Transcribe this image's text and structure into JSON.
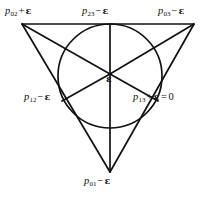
{
  "figure": {
    "type": "geometry-diagram",
    "background_color": "#ffffff",
    "stroke_color": "#111111"
  },
  "labels": {
    "top_left": {
      "name": "p02-plus-epsilon",
      "variable": "p",
      "subscript": "02",
      "operator": "+",
      "epsilon": "ε",
      "full_text": "p02 + ε"
    },
    "top_center": {
      "name": "p23-minus-epsilon",
      "variable": "p",
      "subscript": "23",
      "operator": "−",
      "epsilon": "ε",
      "full_text": "p23 − ε"
    },
    "top_right": {
      "name": "p03-minus-epsilon",
      "variable": "p",
      "subscript": "03",
      "operator": "−",
      "epsilon": "ε",
      "full_text": "p03 − ε"
    },
    "mid_left": {
      "name": "p12-minus-epsilon",
      "variable": "p",
      "subscript": "12",
      "operator": "−",
      "epsilon": "ε",
      "full_text": "p12 − ε"
    },
    "mid_right": {
      "name": "p13-plus-epsilon-equals-zero",
      "variable": "p",
      "subscript": "13",
      "operator": "+",
      "epsilon": "ε",
      "equals": "=",
      "value": "0",
      "full_text": "p13 + ε = 0"
    },
    "bottom": {
      "name": "p01-minus-epsilon",
      "variable": "p",
      "subscript": "01",
      "operator": "−",
      "epsilon": "ε",
      "full_text": "p01 − ε"
    },
    "center": {
      "name": "epsilon-center",
      "epsilon": "ε",
      "full_text": "ε"
    }
  },
  "geometry": {
    "triangle_vertices": [
      {
        "name": "top-left-vertex",
        "x": 22,
        "y": 24
      },
      {
        "name": "top-right-vertex",
        "x": 194,
        "y": 24
      },
      {
        "name": "bottom-vertex",
        "x": 110,
        "y": 172
      }
    ],
    "incircle": {
      "cx": 110,
      "cy": 76,
      "r": 52
    },
    "incenter": {
      "x": 110,
      "y": 74
    },
    "tangent_points": [
      {
        "name": "top-tangent",
        "x": 110,
        "y": 24
      },
      {
        "name": "left-lower-tangent",
        "x": 71,
        "y": 101
      },
      {
        "name": "right-lower-tangent",
        "x": 149,
        "y": 101
      }
    ]
  }
}
